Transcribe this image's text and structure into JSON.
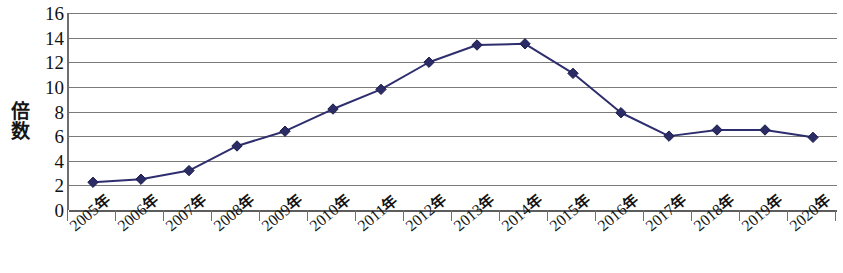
{
  "chart_data": {
    "type": "line",
    "title": "",
    "xlabel": "",
    "ylabel": "倍数",
    "categories": [
      "2005年",
      "2006年",
      "2007年",
      "2008年",
      "2009年",
      "2010年",
      "2011年",
      "2012年",
      "2013年",
      "2014年",
      "2015年",
      "2016年",
      "2017年",
      "2018年",
      "2019年",
      "2020年"
    ],
    "values": [
      2.25,
      2.5,
      3.2,
      5.2,
      6.4,
      8.2,
      9.8,
      12.0,
      13.4,
      13.5,
      11.1,
      7.9,
      6.0,
      6.5,
      6.5,
      5.9
    ],
    "series": [
      {
        "name": "倍数",
        "values": [
          2.25,
          2.5,
          3.2,
          5.2,
          6.4,
          8.2,
          9.8,
          12.0,
          13.4,
          13.5,
          11.1,
          7.9,
          6.0,
          6.5,
          6.5,
          5.9
        ]
      }
    ],
    "ylim": [
      0,
      16
    ],
    "ytick_values": [
      0,
      2,
      4,
      6,
      8,
      10,
      12,
      14,
      16
    ],
    "ytick_labels": [
      "0",
      "2",
      "4",
      "6",
      "8",
      "10",
      "12",
      "14",
      "16"
    ],
    "grid": true,
    "grid_axis": "y",
    "legend": false,
    "legend_position": "none",
    "marker": "diamond",
    "xtick_label_rotation": -40,
    "colors": {
      "series_line": "#2e2e6e",
      "marker_fill": "#2b2b66",
      "marker_edge": "#1d1d4d",
      "gridline": "#7b7b7b",
      "axis": "#5d5d5d",
      "background": "#ffffff",
      "text": "#141414"
    }
  }
}
